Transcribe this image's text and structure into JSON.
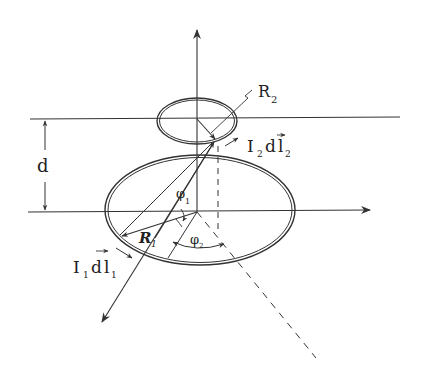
{
  "diagram": {
    "type": "physics-figure",
    "labels": {
      "r2": "R",
      "r2_sub": "2",
      "r1": "R",
      "r1_sub": "1",
      "d": "d",
      "i2_main": "I",
      "i2_sub": "2",
      "i2_dl": "d",
      "i2_l": "l",
      "i2_l_sub": "2",
      "i1_main": "I",
      "i1_sub": "1",
      "i1_dl": "d",
      "i1_l": "l",
      "i1_l_sub": "1",
      "phi1": "φ",
      "phi1_sub": "1",
      "phi2": "φ",
      "phi2_sub": "2"
    },
    "colors": {
      "ink": "#333333",
      "background": "#ffffff"
    }
  }
}
